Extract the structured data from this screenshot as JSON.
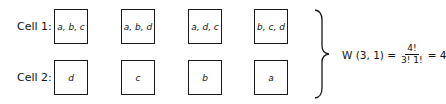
{
  "rows": [
    {
      "label": "Cell 1:",
      "cells": [
        "a, b, c",
        "a, b, d",
        "a, d, c",
        "b, c, d"
      ]
    },
    {
      "label": "Cell 2:",
      "cells": [
        "d",
        "c",
        "b",
        "a"
      ]
    }
  ],
  "formula": {
    "lhs": "W (3, 1) =",
    "numerator": "4!",
    "denominator": "3! 1!",
    "rhs": "= 4"
  }
}
